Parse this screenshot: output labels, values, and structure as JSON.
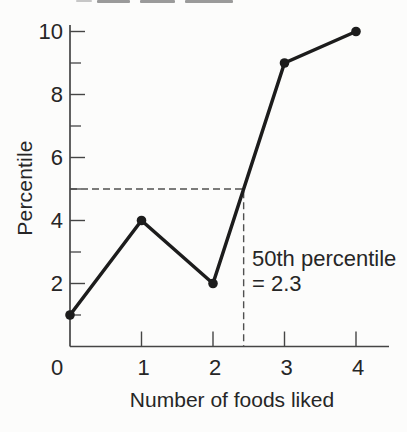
{
  "chart_data": {
    "type": "line",
    "x": [
      0,
      1,
      2,
      3,
      4
    ],
    "y": [
      1,
      4,
      2,
      9,
      10
    ],
    "x_tick_labels": [
      "0",
      "1",
      "2",
      "3",
      "4"
    ],
    "y_major_ticks": [
      2,
      4,
      6,
      8,
      10
    ],
    "y_major_tick_labels": [
      "2",
      "4",
      "6",
      "8",
      "10"
    ],
    "y_minor_ticks": [
      1,
      3,
      5,
      7,
      9
    ],
    "xlabel": "Number of foods liked",
    "ylabel": "Percentile",
    "xlim": [
      0,
      4.5
    ],
    "ylim": [
      0,
      10.2
    ],
    "grid": false,
    "legend": "none",
    "marker": "filled-circle",
    "annotation": {
      "line1": "50th percentile",
      "line2": "= 2.3",
      "value": 2.3,
      "reference_percentile_y": 5
    },
    "colors": {
      "line": "#1c1c1c",
      "marker": "#1c1c1c",
      "axis": "#454545",
      "dashed_reference": "#505050",
      "text": "#262626",
      "background": "#fcfcfb"
    }
  }
}
